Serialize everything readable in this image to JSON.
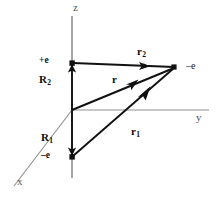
{
  "figure": {
    "background_color": "#ffffff",
    "axis_color": "#8c8c8c",
    "vector_color": "#111111",
    "width": 219,
    "height": 199
  },
  "axes": [
    {
      "name": "z",
      "label": "z",
      "direction": "up",
      "label_x": 74,
      "label_y": 4
    },
    {
      "name": "y",
      "label": "y",
      "direction": "right",
      "label_x": 196,
      "label_y": 113
    },
    {
      "name": "x",
      "label": "x",
      "direction": "lower-left",
      "label_x": 17,
      "label_y": 178
    }
  ],
  "charges": [
    {
      "name": "positive-charge",
      "label": "+e",
      "label_x": 40,
      "label_y": 57,
      "point_x": 72,
      "point_y": 63
    },
    {
      "name": "negative-charge",
      "label": "–e",
      "label_x": 41,
      "label_y": 152,
      "point_x": 72,
      "point_y": 157
    },
    {
      "name": "field-point-charge",
      "label": "–e",
      "label_x": 186,
      "label_y": 63,
      "point_x": 174,
      "point_y": 67
    }
  ],
  "vectors": [
    {
      "name": "R2",
      "label": "R",
      "sub": "2",
      "label_x": 40,
      "label_y": 75,
      "from": "origin",
      "to": "positive-charge"
    },
    {
      "name": "R1",
      "label": "R",
      "sub": "1",
      "label_x": 41,
      "label_y": 133,
      "from": "origin",
      "to": "negative-charge"
    },
    {
      "name": "r",
      "label": "r",
      "sub": "",
      "label_x": 112,
      "label_y": 76,
      "from": "origin",
      "to": "field-point"
    },
    {
      "name": "r1",
      "label": "r",
      "sub": "1",
      "label_x": 131,
      "label_y": 127,
      "from": "negative-charge",
      "to": "field-point"
    },
    {
      "name": "r2",
      "label": "r",
      "sub": "2",
      "label_x": 137,
      "label_y": 48,
      "from": "positive-charge",
      "to": "field-point"
    }
  ],
  "origin": {
    "name": "origin",
    "x": 72,
    "y": 110
  }
}
